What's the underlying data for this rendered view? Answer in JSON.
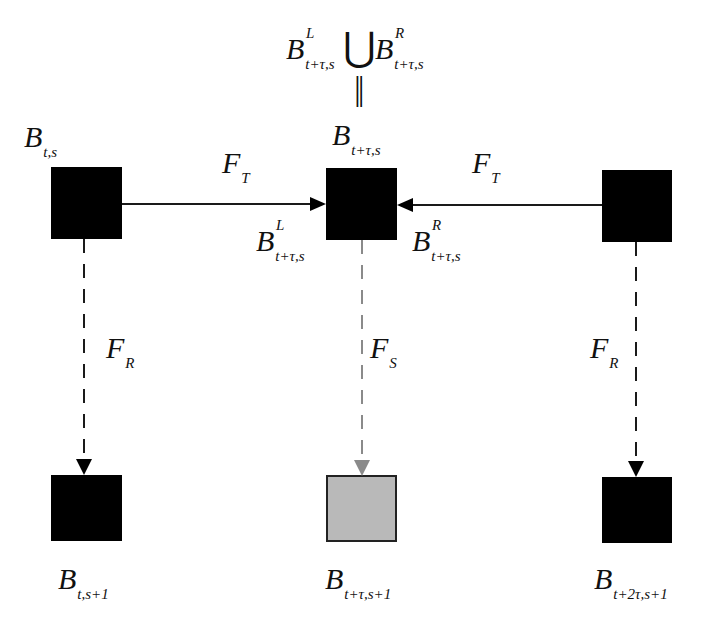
{
  "diagram": {
    "top_formula": {
      "left": {
        "base": "B",
        "sup": "L",
        "sub": "t+τ,s"
      },
      "union_symbol": "⋃",
      "right": {
        "base": "B",
        "sup": "R",
        "sub": "t+τ,s"
      },
      "equals_symbol": "||"
    },
    "nodes": [
      {
        "id": "B_t_s",
        "base": "B",
        "sub": "t,s",
        "fill": "#000000",
        "row": "top",
        "col": "left"
      },
      {
        "id": "B_t_tau_s",
        "base": "B",
        "sub": "t+τ,s",
        "fill": "#000000",
        "row": "top",
        "col": "center"
      },
      {
        "id": "B_t_2tau_s_top_right",
        "base": "",
        "sub": "",
        "fill": "#000000",
        "row": "top",
        "col": "right"
      },
      {
        "id": "B_t_s1",
        "base": "B",
        "sub": "t,s+1",
        "fill": "#000000",
        "row": "bottom",
        "col": "left"
      },
      {
        "id": "B_t_tau_s1",
        "base": "B",
        "sub": "t+τ,s+1",
        "fill": "#b9b9b9",
        "row": "bottom",
        "col": "center"
      },
      {
        "id": "B_t_2tau_s1",
        "base": "B",
        "sub": "t+2τ,s+1",
        "fill": "#000000",
        "row": "bottom",
        "col": "right"
      }
    ],
    "edge_labels": {
      "ft_left": {
        "base": "F",
        "sub": "T"
      },
      "ft_right": {
        "base": "F",
        "sub": "T"
      },
      "fr_left": {
        "base": "F",
        "sub": "R"
      },
      "fs_center": {
        "base": "F",
        "sub": "S"
      },
      "fr_right": {
        "base": "F",
        "sub": "R"
      }
    },
    "port_labels": {
      "left_port": {
        "base": "B",
        "sup": "L",
        "sub": "t+τ,s"
      },
      "right_port": {
        "base": "B",
        "sup": "R",
        "sub": "t+τ,s"
      }
    },
    "colors": {
      "node_dark": "#000000",
      "node_gray": "#b9b9b9",
      "edge_dark": "#1a1a1a",
      "edge_gray": "#8a8a8a"
    }
  }
}
